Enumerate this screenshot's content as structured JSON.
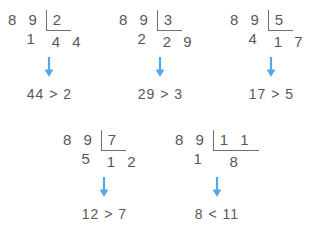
{
  "colors": {
    "text": "#58585a",
    "rule": "#6f7073",
    "arrow": "#57a8e6",
    "background": "#ffffff"
  },
  "icons": {
    "arrow": "down-arrow-icon"
  },
  "problems": [
    {
      "id": "divide-by-2",
      "dividend": "8 9",
      "divisor": "2",
      "remainder": "1",
      "quotient": "4 4",
      "comparison": "44 > 2",
      "x": 8,
      "y": 10
    },
    {
      "id": "divide-by-3",
      "dividend": "8 9",
      "divisor": "3",
      "remainder": "2",
      "quotient": "2 9",
      "comparison": "29 > 3",
      "x": 119,
      "y": 10
    },
    {
      "id": "divide-by-5",
      "dividend": "8 9",
      "divisor": "5",
      "remainder": "4",
      "quotient": "1 7",
      "comparison": "17 > 5",
      "x": 230,
      "y": 10
    },
    {
      "id": "divide-by-7",
      "dividend": "8 9",
      "divisor": "7",
      "remainder": "5",
      "quotient": "1 2",
      "comparison": "12 > 7",
      "x": 63,
      "y": 130
    },
    {
      "id": "divide-by-11",
      "dividend": "8 9",
      "divisor": "1 1",
      "remainder": "1",
      "quotient": "8",
      "comparison": "8 < 11",
      "x": 175,
      "y": 130
    }
  ]
}
